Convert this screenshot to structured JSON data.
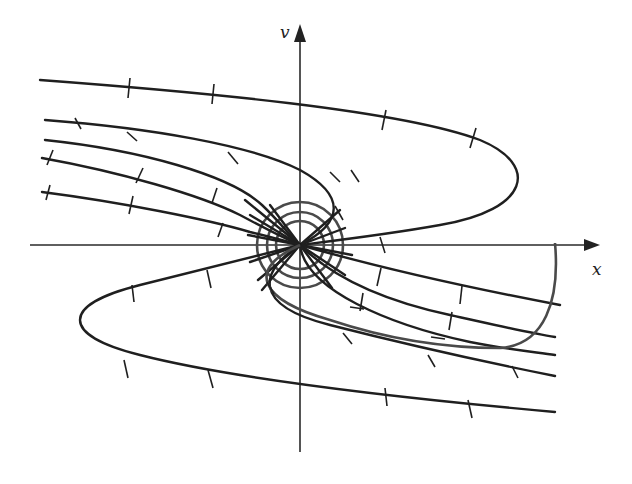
{
  "diagram": {
    "type": "phase-portrait",
    "axes": {
      "horizontal_label": "x",
      "vertical_label": "v",
      "origin": [
        300,
        245
      ]
    },
    "colors": {
      "curve": "#1f1f1f",
      "nullcline": "#4a4a4a",
      "background": "#ffffff"
    },
    "trajectories": [
      {
        "name": "trajectory-top-parabola",
        "d": "M40,80 C200,92 400,110 480,140 C540,165 530,210 440,225 C390,234 340,240 300,245"
      },
      {
        "name": "trajectory-bottom-parabola",
        "d": "M555,412 C400,398 230,378 140,355 C60,335 60,305 140,285 C200,270 260,255 300,245"
      },
      {
        "name": "trajectory-upper-1",
        "d": "M45,120 C150,128 250,145 300,170 C345,195 345,222 300,245"
      },
      {
        "name": "trajectory-upper-2",
        "d": "M45,140 C140,150 230,175 262,205 C280,222 290,236 300,245"
      },
      {
        "name": "trajectory-upper-3",
        "d": "M42,158 C120,172 200,195 240,215 C268,230 288,240 300,245"
      },
      {
        "name": "trajectory-upper-4",
        "d": "M42,192 C120,202 210,220 250,232 C275,238 290,242 300,245"
      },
      {
        "name": "trajectory-lower-1",
        "d": "M300,245 C380,268 470,288 560,305"
      },
      {
        "name": "trajectory-lower-2",
        "d": "M300,245 C330,275 380,300 450,315 C500,326 530,333 555,337"
      },
      {
        "name": "trajectory-lower-3",
        "d": "M300,245 C305,290 390,325 470,342 C510,350 535,352 555,355"
      },
      {
        "name": "trajectory-lower-4",
        "d": "M300,245 C260,270 250,305 330,325 C420,348 500,365 555,376"
      }
    ],
    "nullcline": {
      "name": "nullcline-curve",
      "d": "M555,243 C560,300 545,345 500,348 C420,348 360,330 330,320 C260,300 245,270 300,245"
    },
    "circles": [
      {
        "name": "circle-inner",
        "r": 24
      },
      {
        "name": "circle-middle",
        "r": 33
      },
      {
        "name": "circle-outer",
        "r": 43
      }
    ],
    "rays": [
      [
        300,
        245,
        245,
        200
      ],
      [
        300,
        245,
        250,
        215
      ],
      [
        300,
        245,
        248,
        235
      ],
      [
        300,
        245,
        250,
        262
      ],
      [
        300,
        245,
        258,
        280
      ],
      [
        300,
        245,
        340,
        210
      ],
      [
        300,
        245,
        345,
        228
      ],
      [
        300,
        245,
        352,
        255
      ],
      [
        300,
        245,
        345,
        275
      ],
      [
        300,
        245,
        332,
        288
      ],
      [
        300,
        245,
        270,
        205
      ],
      [
        300,
        245,
        262,
        290
      ]
    ],
    "ticks": [
      [
        130,
        78,
        128,
        98
      ],
      [
        214,
        84,
        212,
        104
      ],
      [
        386,
        110,
        382,
        130
      ],
      [
        476,
        128,
        470,
        148
      ],
      [
        75,
        118,
        81,
        129
      ],
      [
        127,
        132,
        137,
        141
      ],
      [
        228,
        152,
        238,
        164
      ],
      [
        330,
        172,
        340,
        182
      ],
      [
        335,
        206,
        343,
        220
      ],
      [
        53,
        150,
        47,
        165
      ],
      [
        143,
        168,
        136,
        183
      ],
      [
        217,
        188,
        212,
        203
      ],
      [
        50,
        185,
        46,
        200
      ],
      [
        133,
        196,
        129,
        214
      ],
      [
        223,
        223,
        218,
        237
      ],
      [
        351,
        170,
        359,
        182
      ],
      [
        380,
        237,
        385,
        253
      ],
      [
        132,
        285,
        134,
        302
      ],
      [
        207,
        270,
        211,
        288
      ],
      [
        124,
        360,
        128,
        378
      ],
      [
        208,
        370,
        213,
        388
      ],
      [
        385,
        388,
        387,
        406
      ],
      [
        468,
        400,
        472,
        418
      ],
      [
        381,
        268,
        377,
        286
      ],
      [
        462,
        286,
        460,
        304
      ],
      [
        363,
        293,
        360,
        311
      ],
      [
        452,
        312,
        449,
        330
      ],
      [
        343,
        333,
        352,
        344
      ],
      [
        428,
        355,
        435,
        367
      ],
      [
        512,
        366,
        518,
        378
      ],
      [
        350,
        307,
        364,
        309
      ],
      [
        431,
        337,
        445,
        339
      ],
      [
        267,
        282,
        274,
        294
      ]
    ]
  }
}
